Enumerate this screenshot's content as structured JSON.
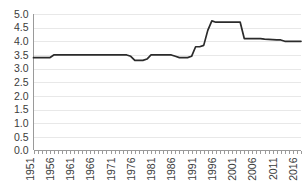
{
  "chart_data": {
    "type": "line",
    "title": "",
    "subtitle": "",
    "xlabel": "",
    "ylabel": "",
    "grid": true,
    "legend": false,
    "legend_position": "none",
    "ylim": [
      0.0,
      5.0
    ],
    "xlim": [
      1951,
      2017
    ],
    "ytick_labels": [
      "5.0",
      "4.5",
      "4.0",
      "3.5",
      "3.0",
      "2.5",
      "2.0",
      "1.5",
      "1.0",
      "0.5",
      "0.0"
    ],
    "ytick_values": [
      5.0,
      4.5,
      4.0,
      3.5,
      3.0,
      2.5,
      2.0,
      1.5,
      1.0,
      0.5,
      0.0
    ],
    "xtick_labels": [
      "1951",
      "1956",
      "1961",
      "1966",
      "1971",
      "1976",
      "1981",
      "1986",
      "1991",
      "1996",
      "2001",
      "2006",
      "2011",
      "2016"
    ],
    "xtick_values": [
      1951,
      1956,
      1961,
      1966,
      1971,
      1976,
      1981,
      1986,
      1991,
      1996,
      2001,
      2006,
      2011,
      2016
    ],
    "series": [
      {
        "name": "value",
        "color": "#2b2b2b",
        "x": [
          1951,
          1952,
          1953,
          1954,
          1955,
          1956,
          1957,
          1958,
          1959,
          1960,
          1961,
          1962,
          1963,
          1964,
          1965,
          1966,
          1967,
          1968,
          1969,
          1970,
          1971,
          1972,
          1973,
          1974,
          1975,
          1976,
          1977,
          1978,
          1979,
          1980,
          1981,
          1982,
          1983,
          1984,
          1985,
          1986,
          1987,
          1988,
          1989,
          1990,
          1991,
          1992,
          1993,
          1994,
          1995,
          1996,
          1997,
          1998,
          1999,
          2000,
          2001,
          2002,
          2003,
          2004,
          2005,
          2006,
          2007,
          2008,
          2009,
          2010,
          2011,
          2012,
          2013,
          2014,
          2015,
          2016,
          2017
        ],
        "values": [
          3.4,
          3.4,
          3.4,
          3.4,
          3.4,
          3.5,
          3.5,
          3.5,
          3.5,
          3.5,
          3.5,
          3.5,
          3.5,
          3.5,
          3.5,
          3.5,
          3.5,
          3.5,
          3.5,
          3.5,
          3.5,
          3.5,
          3.5,
          3.5,
          3.45,
          3.3,
          3.3,
          3.3,
          3.35,
          3.5,
          3.5,
          3.5,
          3.5,
          3.5,
          3.5,
          3.45,
          3.4,
          3.4,
          3.4,
          3.45,
          3.8,
          3.8,
          3.85,
          4.4,
          4.75,
          4.7,
          4.7,
          4.7,
          4.7,
          4.7,
          4.7,
          4.7,
          4.1,
          4.1,
          4.1,
          4.1,
          4.1,
          4.08,
          4.07,
          4.06,
          4.05,
          4.05,
          4.0,
          4.0,
          4.0,
          4.0,
          4.0
        ]
      }
    ]
  },
  "axes": {
    "y_axis_name": "y-axis",
    "x_axis_name": "x-axis"
  }
}
